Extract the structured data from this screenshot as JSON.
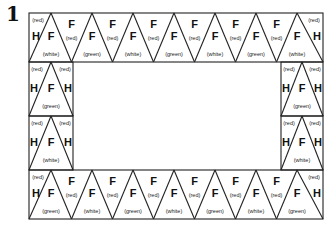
{
  "figure_number": "1",
  "pattern": {
    "top_row": {
      "left_half": {
        "letter": "H",
        "color": "(red)"
      },
      "up_triangles": [
        {
          "letter": "F",
          "color": "(white)"
        },
        {
          "letter": "F",
          "color": "(green)"
        },
        {
          "letter": "F",
          "color": "(white)"
        },
        {
          "letter": "F",
          "color": "(green)"
        },
        {
          "letter": "F",
          "color": "(white)"
        },
        {
          "letter": "F",
          "color": "(green)"
        },
        {
          "letter": "F",
          "color": "(white)"
        }
      ],
      "down_triangles": [
        {
          "letter": "F",
          "color": "(red)"
        },
        {
          "letter": "F",
          "color": "(red)"
        },
        {
          "letter": "F",
          "color": "(red)"
        },
        {
          "letter": "F",
          "color": "(red)"
        },
        {
          "letter": "F",
          "color": "(red)"
        },
        {
          "letter": "F",
          "color": "(red)"
        }
      ],
      "right_half": {
        "letter": "H",
        "color": "(red)"
      }
    },
    "left_side": [
      {
        "center": {
          "letter": "F",
          "color": "(green)"
        },
        "left": {
          "letter": "H",
          "color": "(red)"
        },
        "right": {
          "letter": "H",
          "color": "(red)"
        }
      },
      {
        "center": {
          "letter": "F",
          "color": "(white)"
        },
        "left": {
          "letter": "H",
          "color": "(red)"
        },
        "right": {
          "letter": "H",
          "color": "(red)"
        }
      }
    ],
    "right_side": [
      {
        "center": {
          "letter": "F",
          "color": "(green)"
        },
        "left": {
          "letter": "H",
          "color": "(red)"
        },
        "right": {
          "letter": "H",
          "color": "(red)"
        }
      },
      {
        "center": {
          "letter": "F",
          "color": "(white)"
        },
        "left": {
          "letter": "H",
          "color": "(red)"
        },
        "right": {
          "letter": "H",
          "color": "(red)"
        }
      }
    ],
    "bottom_row": {
      "left_half": {
        "letter": "H",
        "color": "(red)"
      },
      "up_triangles": [
        {
          "letter": "F",
          "color": "(green)"
        },
        {
          "letter": "F",
          "color": "(white)"
        },
        {
          "letter": "F",
          "color": "(green)"
        },
        {
          "letter": "F",
          "color": "(white)"
        },
        {
          "letter": "F",
          "color": "(green)"
        },
        {
          "letter": "F",
          "color": "(white)"
        },
        {
          "letter": "F",
          "color": "(green)"
        }
      ],
      "down_triangles": [
        {
          "letter": "F",
          "color": "(red)"
        },
        {
          "letter": "F",
          "color": "(red)"
        },
        {
          "letter": "F",
          "color": "(red)"
        },
        {
          "letter": "F",
          "color": "(red)"
        },
        {
          "letter": "F",
          "color": "(red)"
        },
        {
          "letter": "F",
          "color": "(red)"
        }
      ],
      "right_half": {
        "letter": "H",
        "color": "(red)"
      }
    }
  }
}
